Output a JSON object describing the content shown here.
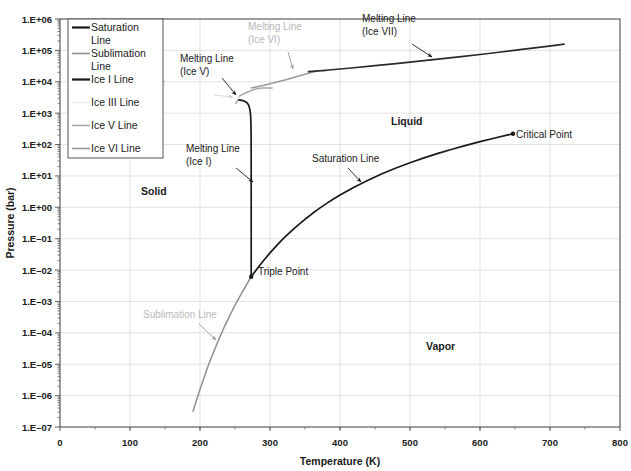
{
  "chart_data": {
    "type": "line",
    "title": "",
    "xlabel": "Temperature (K)",
    "ylabel": "Pressure (bar)",
    "xlim": [
      0,
      800
    ],
    "ylim": [
      1e-07,
      1000000.0
    ],
    "yscale": "log",
    "xscale": "linear",
    "grid": true,
    "x_ticks": [
      "0",
      "100",
      "200",
      "300",
      "400",
      "500",
      "600",
      "700",
      "800"
    ],
    "x_tick_values": [
      0,
      100,
      200,
      300,
      400,
      500,
      600,
      700,
      800
    ],
    "y_ticks": [
      "1.E+06",
      "1.E+05",
      "1.E+04",
      "1.E+03",
      "1.E+02",
      "1.E+01",
      "1.E+00",
      "1.E-01",
      "1.E-02",
      "1.E-03",
      "1.E-04",
      "1.E-05",
      "1.E-06",
      "1.E-07"
    ],
    "y_tick_values": [
      1000000.0,
      100000.0,
      10000.0,
      1000.0,
      100.0,
      10.0,
      1.0,
      0.1,
      0.01,
      0.001,
      0.0001,
      1e-05,
      1e-06,
      1e-07
    ],
    "legend_position": "top-left",
    "series": [
      {
        "name": "Saturation Line",
        "color": "#1a1a1a",
        "width": 1.7,
        "points": [
          [
            273.16,
            0.0061
          ],
          [
            280,
            0.0099
          ],
          [
            290,
            0.0192
          ],
          [
            300,
            0.0354
          ],
          [
            310,
            0.0623
          ],
          [
            320,
            0.1055
          ],
          [
            330,
            0.1719
          ],
          [
            340,
            0.2713
          ],
          [
            350,
            0.4154
          ],
          [
            360,
            0.621
          ],
          [
            370,
            0.906
          ],
          [
            380,
            1.29
          ],
          [
            390,
            1.795
          ],
          [
            400,
            2.458
          ],
          [
            420,
            4.37
          ],
          [
            440,
            7.333
          ],
          [
            460,
            11.71
          ],
          [
            480,
            17.91
          ],
          [
            500,
            26.4
          ],
          [
            520,
            37.7
          ],
          [
            540,
            52.37
          ],
          [
            560,
            71.06
          ],
          [
            580,
            94.5
          ],
          [
            600,
            123.5
          ],
          [
            620,
            159.0
          ],
          [
            640,
            202.7
          ],
          [
            647.1,
            220.6
          ]
        ]
      },
      {
        "name": "Sublimation Line",
        "color": "#8f8f8f",
        "width": 1.5,
        "points": [
          [
            190,
            3.2e-07
          ],
          [
            195,
            7.1e-07
          ],
          [
            200,
            1.6e-06
          ],
          [
            205,
            3.3e-06
          ],
          [
            210,
            7e-06
          ],
          [
            215,
            1.4e-05
          ],
          [
            220,
            2.6e-05
          ],
          [
            225,
            4.9e-05
          ],
          [
            230,
            8.9e-05
          ],
          [
            235,
            0.00016
          ],
          [
            240,
            0.00027
          ],
          [
            245,
            0.00046
          ],
          [
            250,
            0.00076
          ],
          [
            255,
            0.0012
          ],
          [
            260,
            0.00196
          ],
          [
            265,
            0.003
          ],
          [
            270,
            0.0047
          ],
          [
            273.16,
            0.0061
          ]
        ]
      },
      {
        "name": "Ice I Line",
        "color": "#1a1a1a",
        "width": 1.7,
        "points": [
          [
            273.16,
            0.0061
          ],
          [
            273.15,
            1.0
          ],
          [
            273.1,
            50
          ],
          [
            273.0,
            200
          ],
          [
            272.8,
            400
          ],
          [
            272.5,
            700
          ],
          [
            272.0,
            1000
          ],
          [
            271.0,
            1400
          ],
          [
            269.5,
            1800
          ],
          [
            267.5,
            2100
          ],
          [
            264.5,
            2350
          ],
          [
            261.0,
            2500
          ],
          [
            258.0,
            2600
          ],
          [
            254.0,
            2700
          ],
          [
            251.165,
            2085.9
          ]
        ]
      },
      {
        "name": "Ice III Line",
        "color": "#e2e2e2",
        "width": 1.5,
        "points": [
          [
            251.165,
            2085.9
          ],
          [
            252.0,
            2300
          ],
          [
            253.5,
            2700
          ],
          [
            255.0,
            3100
          ],
          [
            256.164,
            3501
          ]
        ]
      },
      {
        "name": "Ice V Line",
        "color": "#a8a8a8",
        "width": 1.5,
        "points": [
          [
            256.164,
            3501
          ],
          [
            260,
            3900
          ],
          [
            265,
            4400
          ],
          [
            270,
            4900
          ],
          [
            275,
            5400
          ],
          [
            280,
            5900
          ],
          [
            285,
            6200
          ],
          [
            290,
            6300
          ],
          [
            295,
            6320
          ],
          [
            300,
            6324
          ],
          [
            303,
            6324
          ]
        ]
      },
      {
        "name": "Ice VI Line",
        "color": "#9a9a9a",
        "width": 1.5,
        "points": [
          [
            273.31,
            6324
          ],
          [
            280,
            6800
          ],
          [
            290,
            7600
          ],
          [
            300,
            8600
          ],
          [
            310,
            9800
          ],
          [
            320,
            11200
          ],
          [
            330,
            12900
          ],
          [
            340,
            14900
          ],
          [
            350,
            17300
          ],
          [
            355,
            18600
          ],
          [
            360,
            20000
          ],
          [
            365,
            21100
          ],
          [
            370,
            22000
          ],
          [
            375,
            22400
          ],
          [
            380,
            22600
          ]
        ]
      },
      {
        "name": "Melting Line (Ice VII)",
        "color": "#2b2b2b",
        "width": 1.7,
        "points": [
          [
            355,
            21000
          ],
          [
            380,
            23300
          ],
          [
            400,
            25500
          ],
          [
            420,
            28000
          ],
          [
            450,
            32500
          ],
          [
            480,
            38000
          ],
          [
            510,
            44500
          ],
          [
            540,
            52500
          ],
          [
            570,
            62000
          ],
          [
            600,
            74000
          ],
          [
            630,
            89000
          ],
          [
            660,
            108000
          ],
          [
            690,
            130000
          ],
          [
            710,
            148000
          ],
          [
            720,
            158000
          ]
        ]
      }
    ],
    "markers": [
      {
        "name": "Triple Point",
        "x": 273.16,
        "y": 0.0061,
        "color": "#1a1a1a"
      },
      {
        "name": "Critical Point",
        "x": 647.1,
        "y": 220.6,
        "color": "#1a1a1a"
      }
    ],
    "annotations": [
      {
        "name": "melting-line-ice-v",
        "lines": [
          "Melting Line",
          "(Ice V)"
        ],
        "tx": 180,
        "ty": 62,
        "anchor": "start",
        "color": "dark",
        "ax": 236,
        "ay": 95,
        "lx": 222,
        "ly": 78
      },
      {
        "name": "melting-line-ice-vi",
        "lines": [
          "Melting Line",
          "(Ice VI)"
        ],
        "tx": 248,
        "ty": 30,
        "anchor": "start",
        "color": "gray",
        "ax": 293,
        "ay": 69,
        "lx": 288,
        "ly": 52
      },
      {
        "name": "melting-line-ice-vii",
        "lines": [
          "Melting Line",
          "(Ice VII)"
        ],
        "tx": 362,
        "ty": 22,
        "anchor": "start",
        "color": "dark",
        "ax": 432,
        "ay": 57,
        "lx": 412,
        "ly": 44
      },
      {
        "name": "melting-line-ice-iii",
        "lines": [
          "Melting Line",
          "(Ice III)"
        ],
        "tx": 112,
        "ty": 86,
        "anchor": "start",
        "color": "lgray",
        "ax": 233,
        "ay": 97,
        "lx": 214,
        "ly": 95
      },
      {
        "name": "melting-line-ice-i",
        "lines": [
          "Melting Line",
          "(Ice I)"
        ],
        "tx": 186,
        "ty": 152,
        "anchor": "start",
        "color": "dark",
        "ax": 253,
        "ay": 182,
        "lx": 236,
        "ly": 168
      },
      {
        "name": "saturation-line",
        "lines": [
          "Saturation Line"
        ],
        "tx": 312,
        "ty": 162,
        "anchor": "start",
        "color": "dark",
        "ax": 361,
        "ay": 182,
        "lx": 348,
        "ly": 168
      },
      {
        "name": "sublimation-line",
        "lines": [
          "Sublimation Line"
        ],
        "tx": 143,
        "ty": 318,
        "anchor": "start",
        "color": "gray",
        "ax": 216,
        "ay": 340,
        "lx": 199,
        "ly": 324
      }
    ],
    "region_labels": [
      {
        "name": "solid-region-label",
        "text": "Solid",
        "x": 141,
        "y": 195
      },
      {
        "name": "liquid-region-label",
        "text": "Liquid",
        "x": 391,
        "y": 125
      },
      {
        "name": "vapor-region-label",
        "text": "Vapor",
        "x": 426,
        "y": 350
      }
    ],
    "point_labels": [
      {
        "name": "triple-point-label",
        "text": "Triple Point",
        "x": 258,
        "y": 275
      },
      {
        "name": "critical-point-label",
        "text": "Critical Point",
        "x": 516,
        "y": 138
      }
    ]
  },
  "legend": {
    "items": [
      {
        "label": "Saturation Line",
        "color": "#1a1a1a",
        "width": 2.2
      },
      {
        "label": "Sublimation Line",
        "color": "#8f8f8f",
        "width": 1.6
      },
      {
        "label": "Ice I Line",
        "color": "#1a1a1a",
        "width": 2.2
      },
      {
        "label": "Ice III Line",
        "color": "#ededed",
        "width": 1.6
      },
      {
        "label": "Ice V Line",
        "color": "#a8a8a8",
        "width": 1.6
      },
      {
        "label": "Ice VI Line",
        "color": "#9a9a9a",
        "width": 1.6
      }
    ]
  },
  "style": {
    "grid_color": "#d9d9d9",
    "axis_color": "#4d4d4d",
    "background": "#ffffff",
    "text_color": "#1a1a1a"
  }
}
